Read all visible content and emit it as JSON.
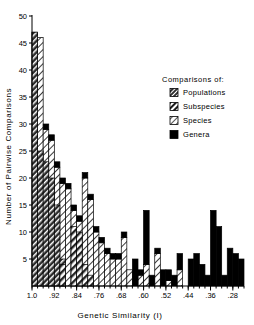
{
  "chart_data": {
    "type": "bar",
    "title": "",
    "xlabel": "Genetic Similarity   (I)",
    "ylabel": "Number of Pairwise Comparisons",
    "xlim": [
      1.0,
      0.24
    ],
    "ylim": [
      0,
      50
    ],
    "ytick_labels": [
      "50",
      "45",
      "40",
      "35",
      "30",
      "25",
      "20",
      "15",
      "10",
      "5"
    ],
    "ytick_values": [
      50,
      45,
      40,
      35,
      30,
      25,
      20,
      15,
      10,
      5
    ],
    "xtick_labels": [
      "1.0",
      ".92",
      ".84",
      ".76",
      ".68",
      ".60",
      ".52",
      ".44",
      ".36",
      ".28"
    ],
    "xtick_values": [
      1.0,
      0.92,
      0.84,
      0.76,
      0.68,
      0.6,
      0.52,
      0.44,
      0.36,
      0.28
    ],
    "grid": false,
    "legend_position": "upper-right",
    "bin_width": 0.02,
    "stacked": true,
    "x_bin_starts": [
      1.0,
      0.98,
      0.96,
      0.94,
      0.92,
      0.9,
      0.88,
      0.86,
      0.84,
      0.82,
      0.8,
      0.78,
      0.76,
      0.74,
      0.72,
      0.7,
      0.68,
      0.66,
      0.64,
      0.62,
      0.6,
      0.58,
      0.56,
      0.54,
      0.52,
      0.5,
      0.48,
      0.46,
      0.44,
      0.42,
      0.4,
      0.38,
      0.36,
      0.34,
      0.32,
      0.3,
      0.28,
      0.26
    ],
    "series": [
      {
        "name": "Populations",
        "fill": "dark-hatch",
        "values": [
          47,
          25,
          23,
          20,
          15,
          5,
          0,
          0,
          0,
          0,
          0,
          0,
          0,
          0,
          0,
          0,
          0,
          0,
          0,
          0,
          0,
          0,
          0,
          0,
          0,
          0,
          0,
          0,
          0,
          0,
          0,
          0,
          0,
          0,
          0,
          0,
          0,
          0
        ]
      },
      {
        "name": "Subspecies",
        "fill": "medium-hatch",
        "values": [
          0,
          0,
          0,
          0,
          0,
          4,
          0,
          11,
          10,
          4,
          2,
          0,
          0,
          0,
          0,
          0,
          0,
          0,
          0,
          0,
          0,
          0,
          0,
          0,
          0,
          0,
          0,
          0,
          0,
          0,
          0,
          0,
          0,
          0,
          0,
          0,
          0,
          0
        ]
      },
      {
        "name": "Species",
        "fill": "light-hatch",
        "values": [
          47,
          46,
          29,
          27,
          22,
          19,
          18,
          14,
          12,
          20,
          16,
          10,
          8,
          6,
          5,
          5,
          9,
          3,
          0,
          2,
          4,
          0,
          6,
          0,
          1,
          0,
          3,
          0,
          0,
          0,
          0,
          0,
          0,
          0,
          0,
          0,
          0,
          0
        ]
      },
      {
        "name": "Genera",
        "fill": "solid-black",
        "values": [
          0,
          0,
          1,
          1,
          1,
          1,
          1,
          1,
          1,
          1,
          1,
          1,
          1,
          1,
          1,
          1,
          1,
          0,
          5,
          1,
          10,
          2,
          1,
          3,
          2,
          2,
          3,
          0,
          5,
          6,
          4,
          2,
          14,
          11,
          2,
          7,
          6,
          5
        ]
      }
    ],
    "legend": {
      "title": "Comparisons of:",
      "entries": [
        {
          "label": "Populations",
          "fill": "dark-hatch"
        },
        {
          "label": "Subspecies",
          "fill": "medium-hatch"
        },
        {
          "label": "Species",
          "fill": "light-hatch"
        },
        {
          "label": "Genera",
          "fill": "solid-black"
        }
      ]
    }
  },
  "axes": {
    "x_title": "Genetic Similarity   (I)",
    "y_title": "Number of Pairwise Comparisons"
  }
}
